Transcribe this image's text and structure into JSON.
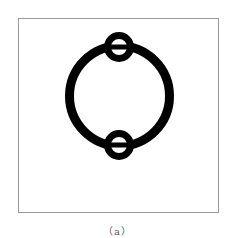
{
  "figure": {
    "caption": "（a）",
    "colors": {
      "stroke": "#000000",
      "frame": "#9a9a9a",
      "background": "#ffffff"
    },
    "main_circle": {
      "cx": 119.5,
      "cy": 96,
      "r": 50,
      "stroke_width": 9
    },
    "rings": [
      {
        "name": "top-ring",
        "cx": 119,
        "cy": 47,
        "r": 11.5,
        "stroke_width": 7
      },
      {
        "name": "bottom-ring",
        "cx": 119,
        "cy": 145,
        "r": 11.5,
        "stroke_width": 7
      }
    ]
  }
}
